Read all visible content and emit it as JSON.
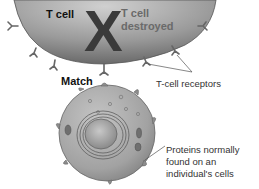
{
  "diagram": {
    "tcell": {
      "label": "T cell",
      "x_mark": "X",
      "status_label": "T cell destroyed"
    },
    "connection_label": "Match",
    "callouts": {
      "receptors": "T-cell receptors",
      "proteins": "Proteins normally found on an individual's cells"
    },
    "colors": {
      "tcell_fill": "#8a8a8a",
      "body_cell_fill": "#a6a6a6",
      "x_mark": "#3a3a3a",
      "leader_line": "#555555"
    }
  }
}
